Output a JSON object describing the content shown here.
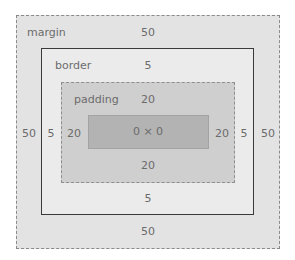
{
  "box_model": {
    "margin": {
      "label": "margin",
      "top": "50",
      "right": "50",
      "bottom": "50",
      "left": "50"
    },
    "border": {
      "label": "border",
      "top": "5",
      "right": "5",
      "bottom": "5",
      "left": "5"
    },
    "padding": {
      "label": "padding",
      "top": "20",
      "right": "20",
      "bottom": "20",
      "left": "20"
    },
    "content": {
      "size": "0 × 0"
    }
  },
  "colors": {
    "margin_fill": "#e3e3e3",
    "border_fill": "#ebebeb",
    "padding_fill": "#cfcfcf",
    "content_fill": "#b3b3b3",
    "text": "#6b6b6b"
  }
}
